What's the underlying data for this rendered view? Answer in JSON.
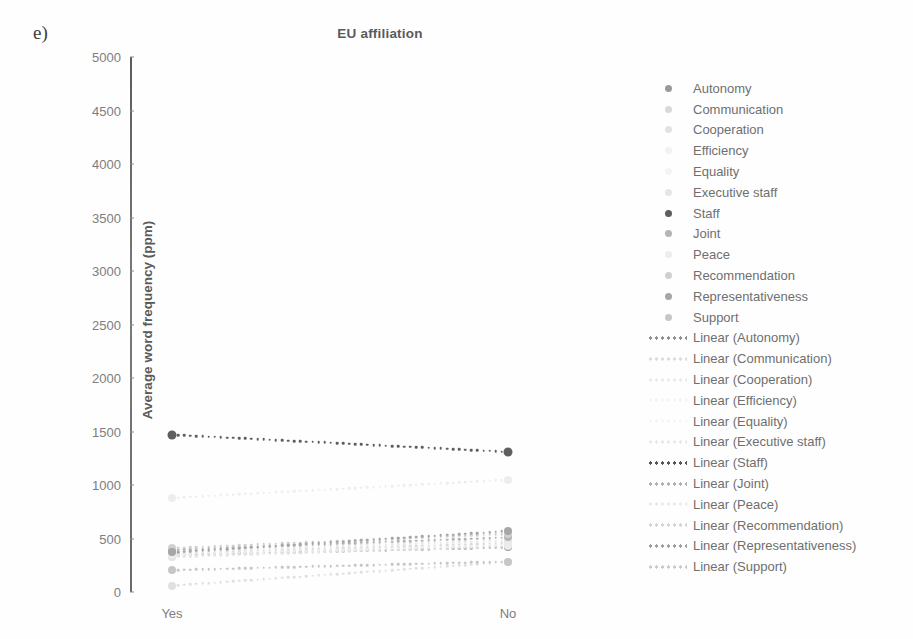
{
  "panel_label": "e)",
  "chart_data": {
    "type": "scatter",
    "title": "EU affiliation",
    "xlabel": "",
    "ylabel": "Average word frequency (ppm)",
    "categories": [
      "Yes",
      "No"
    ],
    "ylim": [
      0,
      5000
    ],
    "yticks": [
      0,
      500,
      1000,
      1500,
      2000,
      2500,
      3000,
      3500,
      4000,
      4500,
      5000
    ],
    "ytick_labels": [
      "0",
      "500",
      "1000",
      "1500",
      "2000",
      "2500",
      "3000",
      "3500",
      "4000",
      "4500",
      "5000"
    ],
    "grid": false,
    "legend_position": "right",
    "note": "Each series is drawn as a dotted trend of points spanning Yes to No; 'Linear (...)' entries are the matching dotted linear trendlines.",
    "series": [
      {
        "name": "Autonomy",
        "values": [
          345,
          420
        ],
        "color": "#9a9a9a",
        "marker_size": 6
      },
      {
        "name": "Communication",
        "values": [
          360,
          455
        ],
        "color": "#d8d8d8",
        "marker_size": 6
      },
      {
        "name": "Cooperation",
        "values": [
          330,
          430
        ],
        "color": "#e2e2e2",
        "marker_size": 6
      },
      {
        "name": "Efficiency",
        "values": [
          380,
          480
        ],
        "color": "#e8e8e8",
        "marker_size": 6
      },
      {
        "name": "Equality",
        "values": [
          350,
          440
        ],
        "color": "#ececec",
        "marker_size": 6
      },
      {
        "name": "Executive staff",
        "values": [
          60,
          280
        ],
        "color": "#e0e0e0",
        "marker_size": 6
      },
      {
        "name": "Staff",
        "values": [
          1470,
          1310
        ],
        "color": "#5e5e5e",
        "marker_size": 7
      },
      {
        "name": "Joint",
        "values": [
          395,
          510
        ],
        "color": "#b4b4b4",
        "marker_size": 6
      },
      {
        "name": "Peace",
        "values": [
          880,
          1050
        ],
        "color": "#ededed",
        "marker_size": 6
      },
      {
        "name": "Recommendation",
        "values": [
          410,
          545
        ],
        "color": "#d0d0d0",
        "marker_size": 6
      },
      {
        "name": "Representativeness",
        "values": [
          370,
          570
        ],
        "color": "#a6a6a6",
        "marker_size": 6
      },
      {
        "name": "Support",
        "values": [
          205,
          285
        ],
        "color": "#c6c6c6",
        "marker_size": 6
      }
    ],
    "trendlines": [
      {
        "name": "Linear (Autonomy)",
        "color": "#8f8f8f"
      },
      {
        "name": "Linear (Communication)",
        "color": "#dcdcdc"
      },
      {
        "name": "Linear (Cooperation)",
        "color": "#e6e6e6"
      },
      {
        "name": "Linear (Efficiency)",
        "color": "#efefef"
      },
      {
        "name": "Linear (Equality)",
        "color": "#f1f1f1"
      },
      {
        "name": "Linear (Executive staff)",
        "color": "#e4e4e4"
      },
      {
        "name": "Linear (Staff)",
        "color": "#565656"
      },
      {
        "name": "Linear (Joint)",
        "color": "#b0b0b0"
      },
      {
        "name": "Linear (Peace)",
        "color": "#ebebeb"
      },
      {
        "name": "Linear (Recommendation)",
        "color": "#cccccc"
      },
      {
        "name": "Linear (Representativeness)",
        "color": "#9f9f9f"
      },
      {
        "name": "Linear (Support)",
        "color": "#c2c2c2"
      }
    ]
  },
  "legend": {
    "markers": [
      {
        "label": "Autonomy",
        "color": "#9a9a9a",
        "kind": "dot"
      },
      {
        "label": "Communication",
        "color": "#d8d8d8",
        "kind": "dot"
      },
      {
        "label": "Cooperation",
        "color": "#e2e2e2",
        "kind": "dot"
      },
      {
        "label": "Efficiency",
        "color": "#f2f2f2",
        "kind": "dot"
      },
      {
        "label": "Equality",
        "color": "#f4f4f4",
        "kind": "dot"
      },
      {
        "label": "Executive staff",
        "color": "#e6e6e6",
        "kind": "dot"
      },
      {
        "label": "Staff",
        "color": "#5e5e5e",
        "kind": "dot"
      },
      {
        "label": "Joint",
        "color": "#b4b4b4",
        "kind": "dot"
      },
      {
        "label": "Peace",
        "color": "#ededed",
        "kind": "dot"
      },
      {
        "label": "Recommendation",
        "color": "#d0d0d0",
        "kind": "dot"
      },
      {
        "label": "Representativeness",
        "color": "#a6a6a6",
        "kind": "dot"
      },
      {
        "label": "Support",
        "color": "#c6c6c6",
        "kind": "dot"
      },
      {
        "label": "Linear (Autonomy)",
        "color": "#8f8f8f",
        "kind": "line"
      },
      {
        "label": "Linear (Communication)",
        "color": "#dcdcdc",
        "kind": "line"
      },
      {
        "label": "Linear (Cooperation)",
        "color": "#ebebeb",
        "kind": "line"
      },
      {
        "label": "Linear (Efficiency)",
        "color": "#f4f4f4",
        "kind": "line"
      },
      {
        "label": "Linear (Equality)",
        "color": "#f6f6f6",
        "kind": "line"
      },
      {
        "label": "Linear (Executive staff)",
        "color": "#e8e8e8",
        "kind": "line"
      },
      {
        "label": "Linear (Staff)",
        "color": "#565656",
        "kind": "line"
      },
      {
        "label": "Linear (Joint)",
        "color": "#b0b0b0",
        "kind": "line"
      },
      {
        "label": "Linear (Peace)",
        "color": "#ebebeb",
        "kind": "line"
      },
      {
        "label": "Linear (Recommendation)",
        "color": "#d4d4d4",
        "kind": "line"
      },
      {
        "label": "Linear (Representativeness)",
        "color": "#9f9f9f",
        "kind": "line"
      },
      {
        "label": "Linear (Support)",
        "color": "#cacaca",
        "kind": "line"
      }
    ]
  }
}
